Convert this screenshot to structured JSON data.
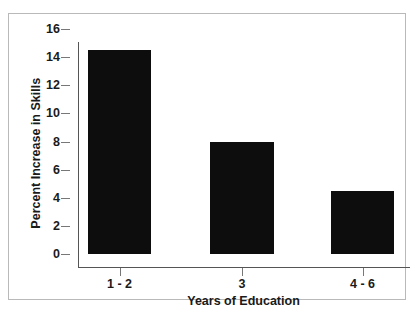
{
  "chart_data": {
    "type": "bar",
    "title": "",
    "subtitle": "",
    "categories": [
      "1 - 2",
      "3",
      "4 - 6"
    ],
    "values": [
      14.5,
      8.0,
      4.5
    ],
    "xlabel": "Years of Education",
    "ylabel": "Percent Increase in Skills",
    "ylim": [
      0,
      16
    ],
    "yticks": [
      0,
      2,
      4,
      6,
      8,
      10,
      12,
      14,
      16
    ],
    "ytick_labels": [
      "0",
      "2",
      "4",
      "6",
      "8",
      "10",
      "12",
      "14",
      "16"
    ],
    "grid": false,
    "legend": false,
    "legend_position": "none",
    "bar_color": "#0d0d0d",
    "background_color": "#ffffff",
    "axis_color": "#555555",
    "frame_color": "#b9b9b9",
    "annotations": []
  },
  "figure": {
    "border_label": "chart-frame"
  }
}
